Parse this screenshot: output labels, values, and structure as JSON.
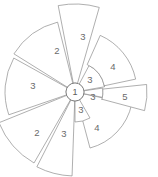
{
  "figure": {
    "title": "",
    "background_color": "#ffffff",
    "stroke_color": "#8d8d8d",
    "label_color": "#6a6a6a",
    "width": 158,
    "height": 177
  },
  "hub": {
    "label": "1",
    "center_x": 75,
    "center_y": 92,
    "radius": 9
  },
  "chart_data": {
    "type": "pie",
    "title": "",
    "subtitle": "",
    "xlabel": "",
    "ylabel": "",
    "grid": false,
    "legend_position": "none",
    "center_label": "1",
    "categories": [
      "3",
      "2",
      "3",
      "2",
      "3",
      "4",
      "3",
      "3",
      "3",
      "5",
      "4",
      "3"
    ],
    "values": [
      3,
      2,
      3,
      2,
      3,
      4,
      3,
      3,
      3,
      5,
      4,
      3
    ],
    "sectors": [
      {
        "id": "sector-top",
        "label": "3",
        "value": 3,
        "start_angle": 74,
        "end_angle": 101,
        "inner_radius": 9,
        "outer_radius": 88,
        "label_radius": 60,
        "label_x": 83,
        "label_y": 37
      },
      {
        "id": "sector-upper-left",
        "label": "2",
        "value": 2,
        "start_angle": 104,
        "end_angle": 148,
        "inner_radius": 9,
        "outer_radius": 72,
        "label_radius": 46,
        "label_x": 57,
        "label_y": 51
      },
      {
        "id": "sector-left",
        "label": "3",
        "value": 3,
        "start_angle": 151,
        "end_angle": 199,
        "inner_radius": 9,
        "outer_radius": 70,
        "label_radius": 44,
        "label_x": 33,
        "label_y": 86
      },
      {
        "id": "sector-lower-left",
        "label": "2",
        "value": 2,
        "start_angle": 202,
        "end_angle": 240,
        "inner_radius": 9,
        "outer_radius": 82,
        "label_radius": 52,
        "label_x": 37,
        "label_y": 133
      },
      {
        "id": "sector-bottom-left",
        "label": "3",
        "value": 3,
        "start_angle": 243,
        "end_angle": 268,
        "inner_radius": 9,
        "outer_radius": 84,
        "label_radius": 54,
        "label_x": 64,
        "label_y": 134
      },
      {
        "id": "sector-bottom-right",
        "label": "4",
        "value": 4,
        "start_angle": 285,
        "end_angle": 348,
        "inner_radius": 9,
        "outer_radius": 58,
        "label_radius": 38,
        "label_x": 97,
        "label_y": 128
      },
      {
        "id": "sector-inner-lower",
        "label": "3",
        "value": 3,
        "start_angle": 270,
        "end_angle": 300,
        "inner_radius": 9,
        "outer_radius": 30,
        "label_radius": 21,
        "label_x": 81,
        "label_y": 110
      },
      {
        "id": "sector-inner-right",
        "label": "3",
        "value": 3,
        "start_angle": 349,
        "end_angle": 8,
        "inner_radius": 9,
        "outer_radius": 28,
        "label_radius": 20,
        "label_x": 93,
        "label_y": 97
      },
      {
        "id": "sector-inner-upper",
        "label": "3",
        "value": 3,
        "start_angle": 10,
        "end_angle": 62,
        "inner_radius": 9,
        "outer_radius": 30,
        "label_radius": 21,
        "label_x": 90,
        "label_y": 80
      },
      {
        "id": "sector-right",
        "label": "5",
        "value": 5,
        "start_angle": 345,
        "end_angle": 6,
        "inner_radius": 28,
        "outer_radius": 72,
        "label_radius": 52,
        "label_x": 125,
        "label_y": 97
      },
      {
        "id": "sector-upper-right",
        "label": "4",
        "value": 4,
        "start_angle": 12,
        "end_angle": 66,
        "inner_radius": 30,
        "outer_radius": 62,
        "label_radius": 47,
        "label_x": 113,
        "label_y": 67
      }
    ]
  }
}
